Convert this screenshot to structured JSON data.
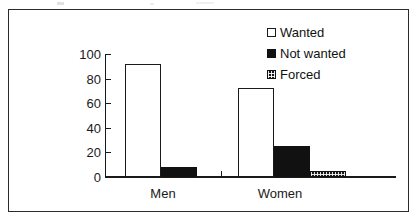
{
  "figure": {
    "border_color": "#2b2b2b",
    "background": "#ffffff"
  },
  "legend": {
    "position": "top-right",
    "entries": [
      {
        "label": "Wanted",
        "swatch": "open-square-white",
        "color": "#ffffff"
      },
      {
        "label": "Not wanted",
        "swatch": "filled-square-black",
        "color": "#111111"
      },
      {
        "label": "Forced",
        "swatch": "hatched-square",
        "color": "#171717"
      }
    ]
  },
  "axes": {
    "y_ticks": [
      "100",
      "80",
      "60",
      "40",
      "20",
      "0"
    ],
    "x_categories": [
      "Men",
      "Women"
    ]
  },
  "chart_data": {
    "type": "bar",
    "title": "",
    "subtitle": "",
    "xlabel": "",
    "ylabel": "",
    "categories": [
      "Men",
      "Women"
    ],
    "series": [
      {
        "name": "Wanted",
        "values": [
          92,
          72
        ]
      },
      {
        "name": "Not wanted",
        "values": [
          8,
          25
        ]
      },
      {
        "name": "Forced",
        "values": [
          0,
          4
        ]
      }
    ],
    "ylim": [
      0,
      100
    ],
    "ytick_values": [
      0,
      20,
      40,
      60,
      80,
      100
    ],
    "grid": false,
    "legend_position": "top-right"
  }
}
